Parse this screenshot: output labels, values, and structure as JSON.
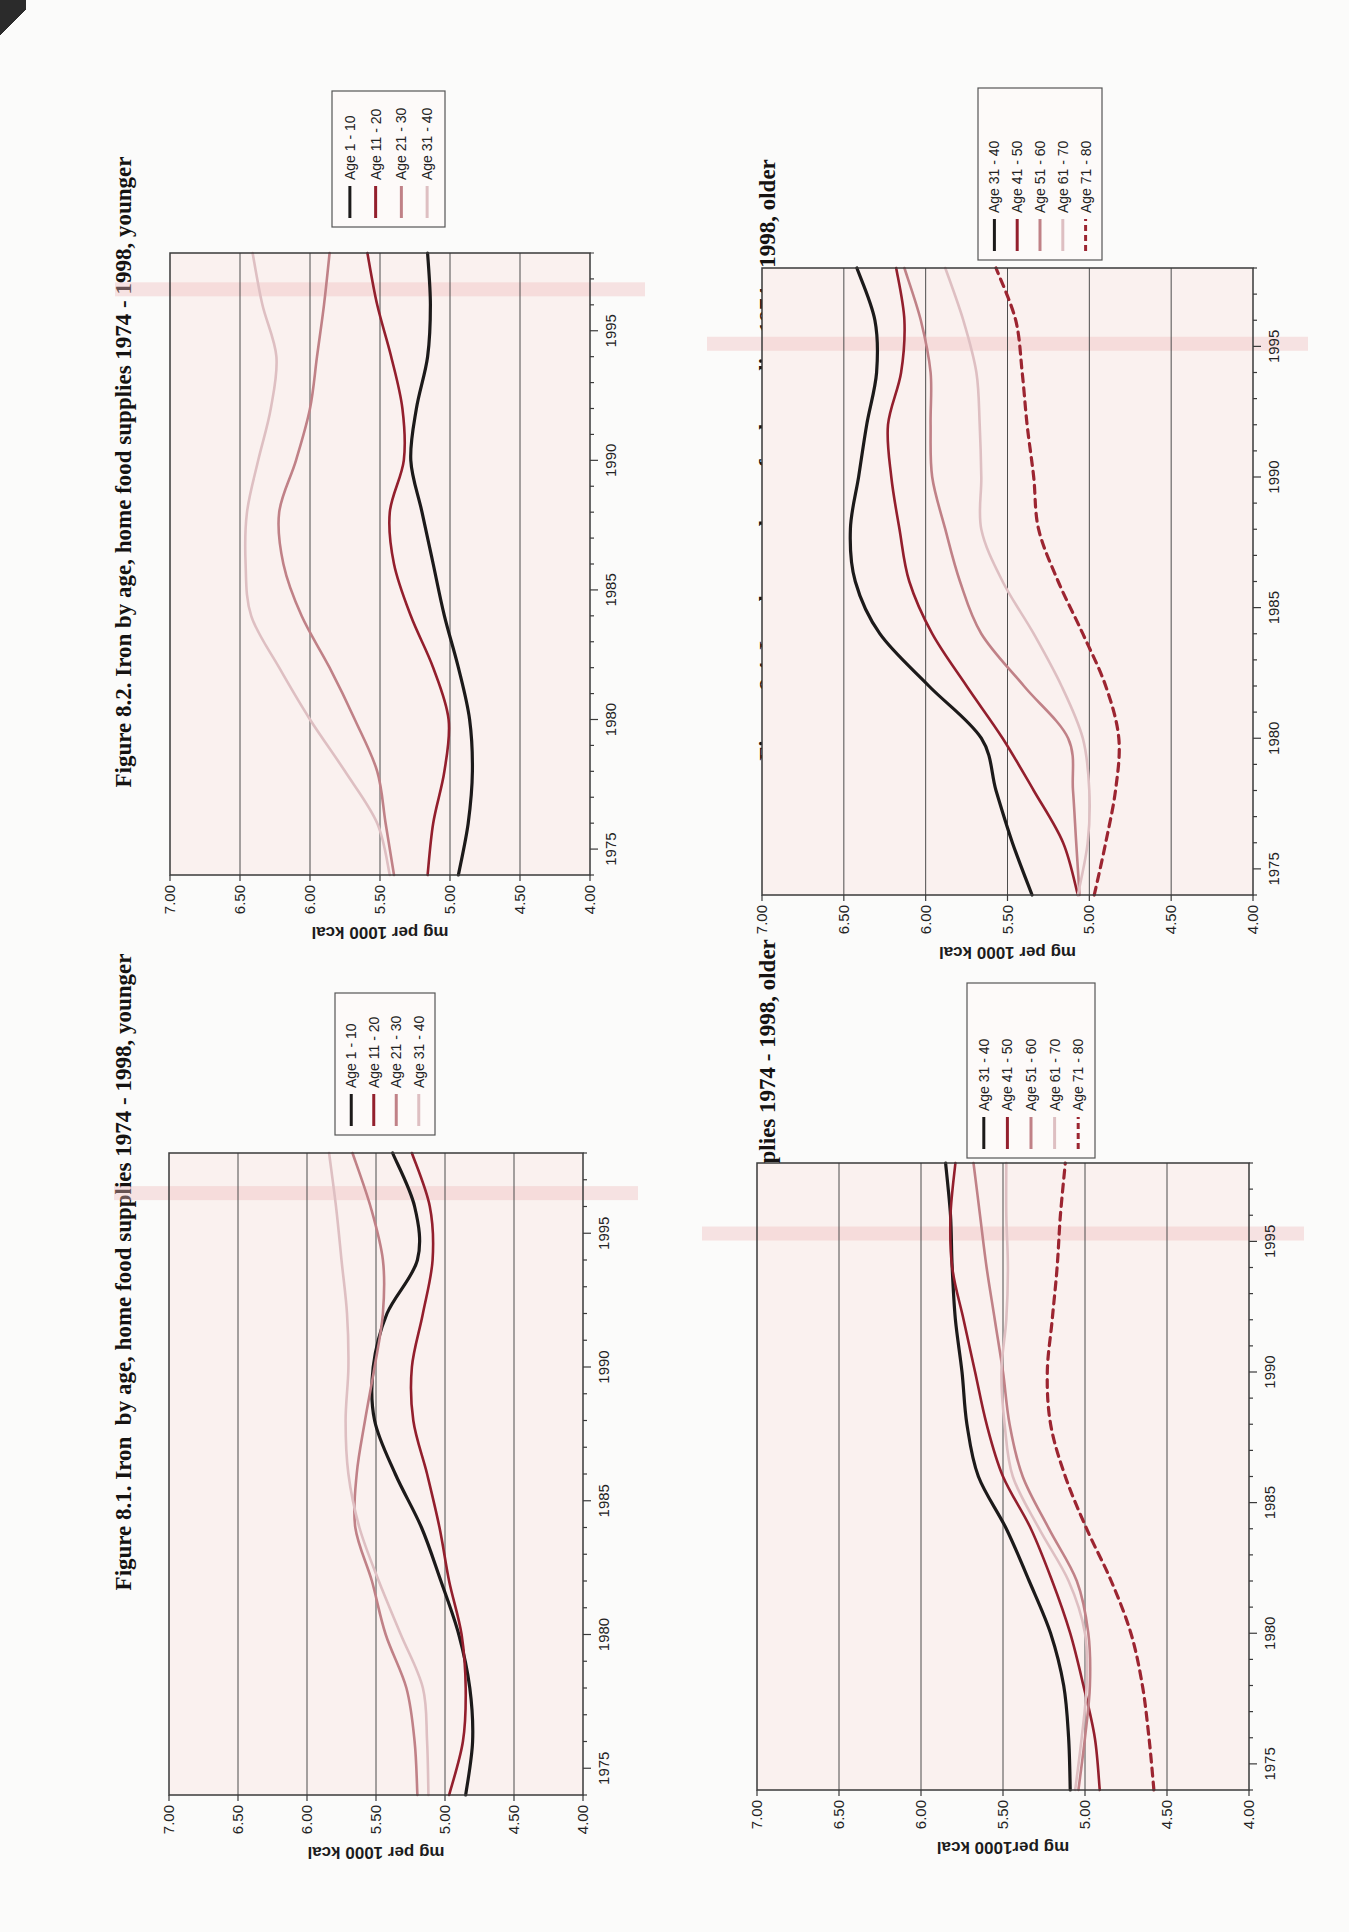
{
  "page": {
    "background": "#fbfbfa",
    "orientation": "landscape page scanned rotated 90 degrees counter-clockwise"
  },
  "colors": {
    "series_black": "#1c1a1a",
    "series_darkred": "#931f2d",
    "series_rose": "#c08187",
    "series_lightpink": "#debfc2",
    "series_dashed_red": "#9c2531",
    "plot_background": "#faf1ef",
    "gridline": "#4d4d4d",
    "plot_border": "#3a3a3a",
    "scan_band": "rgba(238,186,186,0.38)"
  },
  "charts": [
    {
      "id": "figure-8-1",
      "title_line1": "Figure 8.1. Iron  by age, home food supplies 1974 - 1998, younger",
      "title_line2": "males",
      "y_axis_label": "mg per 1000 kcal",
      "y_ticks": [
        "7.00",
        "6.50",
        "6.00",
        "5.50",
        "5.00",
        "4.50",
        "4.00"
      ],
      "x_ticks": [
        "1975",
        "1980",
        "1985",
        "1990",
        "1995"
      ],
      "legend": [
        {
          "label": "Age 1 - 10",
          "color": "#1c1a1a",
          "dash": false
        },
        {
          "label": "Age 11 - 20",
          "color": "#931f2d",
          "dash": false
        },
        {
          "label": "Age 21 - 30",
          "color": "#c08187",
          "dash": false
        },
        {
          "label": "Age 31 - 40",
          "color": "#debfc2",
          "dash": false
        }
      ]
    },
    {
      "id": "figure-8-2",
      "title_line1": "Figure 8.2. Iron by age, home food supplies 1974 - 1998, younger",
      "title_line2": "females",
      "y_axis_label": "mg per 1000 kcal",
      "y_ticks": [
        "7.00",
        "6.50",
        "6.00",
        "5.50",
        "5.00",
        "4.50",
        "4.00"
      ],
      "x_ticks": [
        "1975",
        "1980",
        "1985",
        "1990",
        "1995"
      ],
      "legend": [
        {
          "label": "Age 1 - 10",
          "color": "#1c1a1a",
          "dash": false
        },
        {
          "label": "Age 11 - 20",
          "color": "#931f2d",
          "dash": false
        },
        {
          "label": "Age 21 - 30",
          "color": "#c08187",
          "dash": false
        },
        {
          "label": "Age 31 - 40",
          "color": "#debfc2",
          "dash": false
        }
      ]
    },
    {
      "id": "figure-8-3",
      "title_line1": "Figure 8.3. Iron by age, home food supplies 1974 - 1998, older",
      "title_line2": "males",
      "y_axis_label": "mg per1000 kcal",
      "y_ticks": [
        "7.00",
        "6.50",
        "6.00",
        "5.50",
        "5.00",
        "4.50",
        "4.00"
      ],
      "x_ticks": [
        "1975",
        "1980",
        "1985",
        "1990",
        "1995"
      ],
      "legend": [
        {
          "label": "Age 31 - 40",
          "color": "#1c1a1a",
          "dash": false
        },
        {
          "label": "Age 41 - 50",
          "color": "#931f2d",
          "dash": false
        },
        {
          "label": "Age 51 - 60",
          "color": "#c08187",
          "dash": false
        },
        {
          "label": "Age 61 - 70",
          "color": "#debfc2",
          "dash": false
        },
        {
          "label": "Age 71 - 80",
          "color": "#9c2531",
          "dash": true
        }
      ]
    },
    {
      "id": "figure-8-4",
      "title_line1": "Figure 8.4. Iron by age, home food supplies 1974 - 1998, older",
      "title_line2": "females",
      "y_axis_label": "mg per 1000 kcal",
      "y_ticks": [
        "7.00",
        "6.50",
        "6.00",
        "5.50",
        "5.00",
        "4.50",
        "4.00"
      ],
      "x_ticks": [
        "1975",
        "1980",
        "1985",
        "1990",
        "1995"
      ],
      "legend": [
        {
          "label": "Age 31 - 40",
          "color": "#1c1a1a",
          "dash": false
        },
        {
          "label": "Age 41 - 50",
          "color": "#931f2d",
          "dash": false
        },
        {
          "label": "Age 51 - 60",
          "color": "#c08187",
          "dash": false
        },
        {
          "label": "Age 61 - 70",
          "color": "#debfc2",
          "dash": false
        },
        {
          "label": "Age 71 - 80",
          "color": "#9c2531",
          "dash": true
        }
      ]
    }
  ],
  "chart_data": [
    {
      "type": "line",
      "title": "Figure 8.1. Iron by age, home food supplies 1974 - 1998, younger males",
      "xlabel": "",
      "ylabel": "mg per 1000 kcal",
      "xlim": [
        1974,
        1998
      ],
      "ylim": [
        4.0,
        7.0
      ],
      "y_tick_step": 0.5,
      "x_tick_labels": [
        1975,
        1980,
        1985,
        1990,
        1995
      ],
      "grid": "horizontal",
      "legend_position": "right",
      "x": [
        1974,
        1976,
        1978,
        1980,
        1982,
        1984,
        1986,
        1988,
        1990,
        1992,
        1994,
        1996,
        1998
      ],
      "series": [
        {
          "name": "Age 1 - 10",
          "values": [
            4.85,
            4.8,
            4.82,
            4.9,
            5.03,
            5.17,
            5.36,
            5.51,
            5.52,
            5.42,
            5.2,
            5.22,
            5.38
          ]
        },
        {
          "name": "Age 11 - 20",
          "values": [
            4.97,
            4.87,
            4.85,
            4.88,
            4.97,
            5.04,
            5.13,
            5.23,
            5.24,
            5.16,
            5.09,
            5.11,
            5.24
          ]
        },
        {
          "name": "Age 21 - 30",
          "values": [
            5.2,
            5.22,
            5.28,
            5.43,
            5.53,
            5.65,
            5.64,
            5.58,
            5.51,
            5.45,
            5.45,
            5.54,
            5.67
          ]
        },
        {
          "name": "Age 31 - 40",
          "values": [
            5.12,
            5.13,
            5.16,
            5.32,
            5.48,
            5.62,
            5.7,
            5.72,
            5.7,
            5.71,
            5.75,
            5.79,
            5.84
          ]
        }
      ]
    },
    {
      "type": "line",
      "title": "Figure 8.2. Iron by age, home food supplies 1974 - 1998, younger females",
      "xlabel": "",
      "ylabel": "mg per 1000 kcal",
      "xlim": [
        1974,
        1998
      ],
      "ylim": [
        4.0,
        7.0
      ],
      "y_tick_step": 0.5,
      "x_tick_labels": [
        1975,
        1980,
        1985,
        1990,
        1995
      ],
      "grid": "horizontal",
      "legend_position": "right",
      "x": [
        1974,
        1976,
        1978,
        1980,
        1982,
        1984,
        1986,
        1988,
        1990,
        1992,
        1994,
        1996,
        1998
      ],
      "series": [
        {
          "name": "Age 1 - 10",
          "values": [
            4.94,
            4.87,
            4.84,
            4.86,
            4.94,
            5.04,
            5.12,
            5.2,
            5.28,
            5.24,
            5.16,
            5.14,
            5.16
          ]
        },
        {
          "name": "Age 11 - 20",
          "values": [
            5.16,
            5.12,
            5.04,
            5.01,
            5.12,
            5.28,
            5.4,
            5.43,
            5.33,
            5.34,
            5.42,
            5.52,
            5.59
          ]
        },
        {
          "name": "Age 21 - 30",
          "values": [
            5.4,
            5.46,
            5.52,
            5.68,
            5.86,
            6.06,
            6.19,
            6.22,
            6.1,
            6.0,
            5.95,
            5.9,
            5.86
          ]
        },
        {
          "name": "Age 31 - 40",
          "values": [
            5.43,
            5.52,
            5.75,
            6.0,
            6.22,
            6.42,
            6.46,
            6.45,
            6.37,
            6.28,
            6.24,
            6.34,
            6.41
          ]
        }
      ]
    },
    {
      "type": "line",
      "title": "Figure 8.3. Iron by age, home food supplies 1974 - 1998, older males",
      "xlabel": "",
      "ylabel": "mg per1000 kcal",
      "xlim": [
        1974,
        1998
      ],
      "ylim": [
        4.0,
        7.0
      ],
      "y_tick_step": 0.5,
      "x_tick_labels": [
        1975,
        1980,
        1985,
        1990,
        1995
      ],
      "grid": "horizontal",
      "legend_position": "right",
      "x": [
        1974,
        1976,
        1978,
        1980,
        1982,
        1984,
        1986,
        1988,
        1990,
        1992,
        1994,
        1996,
        1998
      ],
      "series": [
        {
          "name": "Age 31 - 40",
          "values": [
            5.09,
            5.1,
            5.13,
            5.21,
            5.34,
            5.48,
            5.65,
            5.72,
            5.75,
            5.79,
            5.81,
            5.82,
            5.85
          ]
        },
        {
          "name": "Age 41 - 50",
          "values": [
            4.91,
            4.94,
            5.01,
            5.09,
            5.2,
            5.33,
            5.5,
            5.6,
            5.67,
            5.74,
            5.81,
            5.82,
            5.79
          ]
        },
        {
          "name": "Age 51 - 60",
          "values": [
            5.04,
            5.0,
            4.97,
            4.98,
            5.05,
            5.22,
            5.38,
            5.46,
            5.5,
            5.55,
            5.6,
            5.64,
            5.68
          ]
        },
        {
          "name": "Age 61 - 70",
          "values": [
            5.06,
            5.02,
            4.99,
            5.0,
            5.1,
            5.28,
            5.44,
            5.49,
            5.51,
            5.48,
            5.47,
            5.48,
            5.48
          ]
        },
        {
          "name": "Age 71 - 80",
          "values": [
            4.58,
            4.61,
            4.65,
            4.72,
            4.84,
            4.99,
            5.12,
            5.21,
            5.23,
            5.2,
            5.17,
            5.15,
            5.12
          ]
        }
      ]
    },
    {
      "type": "line",
      "title": "Figure 8.4. Iron by age, home food supplies 1974 - 1998, older females",
      "xlabel": "",
      "ylabel": "mg per 1000 kcal",
      "xlim": [
        1974,
        1998
      ],
      "ylim": [
        4.0,
        7.0
      ],
      "y_tick_step": 0.5,
      "x_tick_labels": [
        1975,
        1980,
        1985,
        1990,
        1995
      ],
      "grid": "horizontal",
      "legend_position": "right",
      "x": [
        1974,
        1976,
        1978,
        1980,
        1982,
        1984,
        1986,
        1988,
        1990,
        1992,
        1994,
        1996,
        1998
      ],
      "series": [
        {
          "name": "Age 31 - 40",
          "values": [
            5.35,
            5.47,
            5.57,
            5.66,
            5.98,
            6.28,
            6.43,
            6.46,
            6.41,
            6.36,
            6.3,
            6.31,
            6.42
          ]
        },
        {
          "name": "Age 41 - 50",
          "values": [
            5.07,
            5.16,
            5.34,
            5.53,
            5.75,
            5.96,
            6.1,
            6.16,
            6.21,
            6.23,
            6.15,
            6.13,
            6.18
          ]
        },
        {
          "name": "Age 51 - 60",
          "values": [
            5.06,
            5.08,
            5.1,
            5.13,
            5.4,
            5.66,
            5.79,
            5.88,
            5.96,
            5.97,
            5.97,
            6.03,
            6.13
          ]
        },
        {
          "name": "Age 61 - 70",
          "values": [
            5.07,
            5.01,
            5.0,
            5.04,
            5.17,
            5.34,
            5.53,
            5.66,
            5.66,
            5.67,
            5.69,
            5.77,
            5.88
          ]
        },
        {
          "name": "Age 71 - 80",
          "values": [
            4.97,
            4.9,
            4.84,
            4.82,
            4.9,
            5.04,
            5.19,
            5.31,
            5.34,
            5.38,
            5.41,
            5.45,
            5.57
          ]
        }
      ]
    }
  ]
}
